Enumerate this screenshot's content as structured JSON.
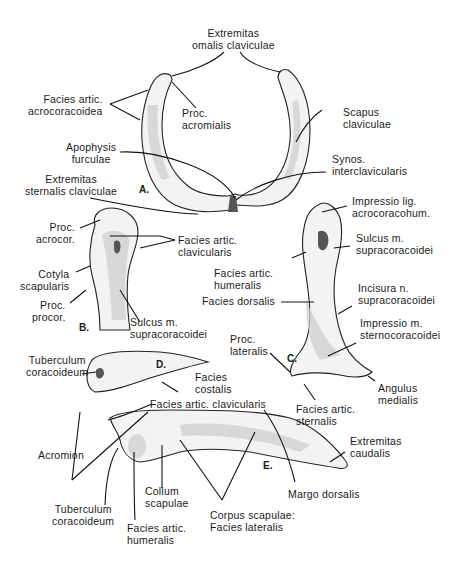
{
  "figures": {
    "A": {
      "letter": "A.",
      "title": "Furcula (clavicles)",
      "labels": {
        "extremitas_omalis": "Extremitas\nomalis claviculae",
        "facies_artic_acrocoracoidea": "Facies artic.\nacrocoracoidea",
        "proc_acromialis": "Proc.\nacromialis",
        "scapus_claviculae": "Scapus\nclaviculae",
        "apophysis_furculae": "Apophysis\nfurculae",
        "synos_interclavicularis": "Synos.\ninterclavicularis",
        "extremitas_sternalis": "Extremitas\nsternalis claviculae"
      }
    },
    "B": {
      "letter": "B.",
      "labels": {
        "proc_acrocor": "Proc.\nacrocor.",
        "facies_artic_clavicularis": "Facies artic.\nclavicularis",
        "cotyla_scapularis": "Cotyla\nscapularis",
        "proc_procor": "Proc.\nprocor.",
        "sulcus_supracoracoidei": "Sulcus m.\nsupracoracoidei"
      }
    },
    "C": {
      "letter": "C.",
      "labels": {
        "impressio_lig": "Impressio lig.\nacrocoracohum.",
        "sulcus_supracoracoidei": "Sulcus m.\nsupracoracoidei",
        "facies_artic_humeralis": "Facies artic.\nhumeralis",
        "facies_dorsalis": "Facies dorsalis",
        "incisura": "Incisura n.\nsupracoracoidei",
        "impressio_sternocoracoidei": "Impressio m.\nsternocoracoidei",
        "proc_lateralis": "Proc.\nlateralis",
        "angulus_medialis": "Angulus\nmedialis",
        "facies_artic_sternalis": "Facies artic.\nsternalis"
      }
    },
    "D": {
      "letter": "D.",
      "labels": {
        "tuberculum_coracoideum": "Tuberculum\ncoracoideum",
        "facies_costalis": "Facies\ncostalis"
      }
    },
    "E": {
      "letter": "E.",
      "labels": {
        "facies_artic_clavicularis": "Facies artic. clavicularis",
        "acromion": "Acromion",
        "extremitas_caudalis": "Extremitas\ncaudalis",
        "collum_scapulae": "Collum\nscapulae",
        "margo_dorsalis": "Margo dorsalis",
        "tuberculum_coracoideum": "Tuberculum\ncoracoideum",
        "facies_artic_humeralis": "Facies artic.\nhumeralis",
        "corpus_scapulae": "Corpus scapulae:\nFacies lateralis"
      }
    }
  }
}
